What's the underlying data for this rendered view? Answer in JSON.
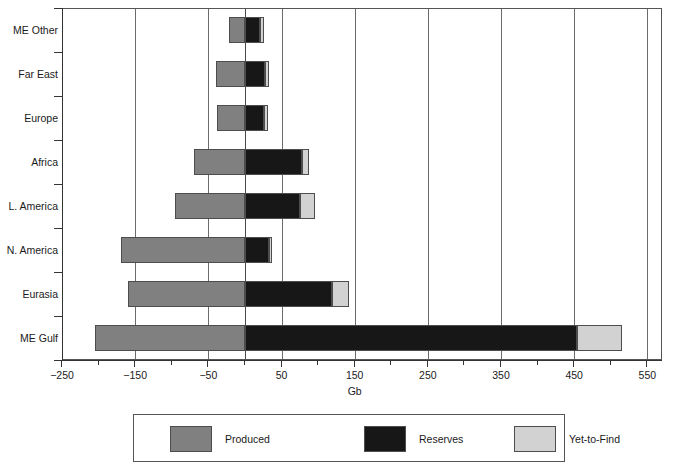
{
  "chart": {
    "type": "bar",
    "orientation": "horizontal",
    "stacked": true,
    "title": "",
    "xlabel": "Gb",
    "ylabel": "",
    "xlim": [
      -250,
      570
    ],
    "xticks_major": [
      -250,
      -150,
      -50,
      50,
      150,
      250,
      350,
      450,
      550
    ],
    "xticks_all": [
      -250,
      -200,
      -150,
      -100,
      -50,
      0,
      50,
      100,
      150,
      200,
      250,
      300,
      350,
      400,
      450,
      500,
      550
    ],
    "grid": "vertical-major",
    "legend_position": "bottom"
  },
  "chart_data": {
    "type": "bar",
    "title": "",
    "xlabel": "Gb",
    "ylabel": "",
    "xlim": [
      -250,
      570
    ],
    "grid": true,
    "legend_position": "bottom",
    "categories": [
      "ME Other",
      "Far East",
      "Europe",
      "Africa",
      "L. America",
      "N. America",
      "Eurasia",
      "ME Gulf"
    ],
    "series": [
      {
        "name": "Produced",
        "color": "#808080",
        "values": [
          -22,
          -40,
          -38,
          -69,
          -96,
          -169,
          -160,
          -205
        ]
      },
      {
        "name": "Reserves",
        "color": "#171717",
        "values": [
          21,
          28,
          26,
          78,
          75,
          33,
          119,
          454
        ]
      },
      {
        "name": "Yet-to-Find",
        "color": "#d2d2d2",
        "values": [
          5,
          5,
          5,
          10,
          21,
          4,
          23,
          62
        ]
      }
    ]
  },
  "axis": {
    "x_tick_labels": [
      "-250",
      "-150",
      "-50",
      "50",
      "150",
      "250",
      "350",
      "450",
      "550"
    ],
    "x_title": "Gb",
    "y_tick_labels": [
      "ME Other",
      "Far East",
      "Europe",
      "Africa",
      "L. America",
      "N. America",
      "Eurasia",
      "ME Gulf"
    ]
  },
  "legend": {
    "items": [
      {
        "label": "Produced",
        "color": "#808080"
      },
      {
        "label": "Reserves",
        "color": "#171717"
      },
      {
        "label": "Yet-to-Find",
        "color": "#d2d2d2"
      }
    ]
  }
}
